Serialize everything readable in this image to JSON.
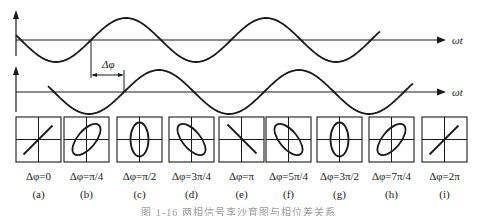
{
  "figure": {
    "top_wave": {
      "axis_label": "ωt"
    },
    "bottom_wave": {
      "axis_label": "ωt"
    },
    "phase_marker": {
      "label": "Δφ"
    },
    "panels": [
      {
        "id": "a",
        "sub": "(a)",
        "label": "Δφ=0",
        "shape": "line-pos",
        "x": 16
      },
      {
        "id": "b",
        "sub": "(b)",
        "label": "Δφ=π/4",
        "shape": "ellipse-pos",
        "x": 64
      },
      {
        "id": "c",
        "sub": "(c)",
        "label": "Δφ=π/2",
        "shape": "ellipse-vert",
        "x": 117
      },
      {
        "id": "d",
        "sub": "(d)",
        "label": "Δφ=3π/4",
        "shape": "ellipse-neg",
        "x": 169
      },
      {
        "id": "e",
        "sub": "(e)",
        "label": "Δφ=π",
        "shape": "line-neg",
        "x": 219
      },
      {
        "id": "f",
        "sub": "(f)",
        "label": "Δφ=5π/4",
        "shape": "ellipse-neg",
        "x": 266
      },
      {
        "id": "g",
        "sub": "(g)",
        "label": "Δφ=3π/2",
        "shape": "ellipse-vert",
        "x": 317
      },
      {
        "id": "h",
        "sub": "(h)",
        "label": "Δφ=7π/4",
        "shape": "ellipse-pos",
        "x": 369
      },
      {
        "id": "i",
        "sub": "(i)",
        "label": "Δφ=2π",
        "shape": "line-pos",
        "x": 422
      }
    ],
    "caption": "图 1-16  两相信号李沙育图与相位差关系"
  },
  "colors": {
    "stroke": "#1a1a1a",
    "background": "#ffffff"
  }
}
